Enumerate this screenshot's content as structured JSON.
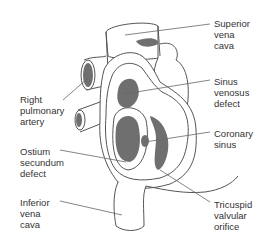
{
  "figure": {
    "colors": {
      "outline": "#555555",
      "defect_fill": "#6f6f6f",
      "leader": "#666666",
      "text": "#333333"
    }
  },
  "labels": {
    "superior_vena_cava": "Superior\nvena\ncava",
    "right_pulmonary_artery": "Right\npulmonary\nartery",
    "sinus_venosus_defect": "Sinus\nvenosus\ndefect",
    "coronary_sinus": "Coronary\nsinus",
    "ostium_secundum_defect": "Ostium\nsecundum\ndefect",
    "inferior_vena_cava": "Inferior\nvena\ncava",
    "tricuspid_valvular_orifice": "Tricuspid\nvalvular\norifice"
  }
}
